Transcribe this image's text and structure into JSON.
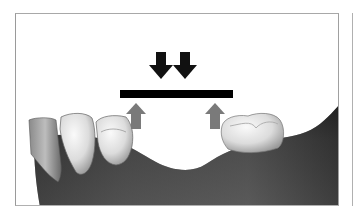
{
  "figure": {
    "title": "",
    "elements": {
      "down_arrows": {
        "count": 2,
        "color": "#111111",
        "label": "occlusal-force"
      },
      "bridge_bar": {
        "color": "#000000",
        "label": "bridge-span"
      },
      "up_arrows": {
        "count": 2,
        "color": "#7a7a7a",
        "label": "abutment-reaction"
      },
      "gum_color": "#3a3a3a",
      "tooth_color": "#e8e8e8"
    }
  }
}
